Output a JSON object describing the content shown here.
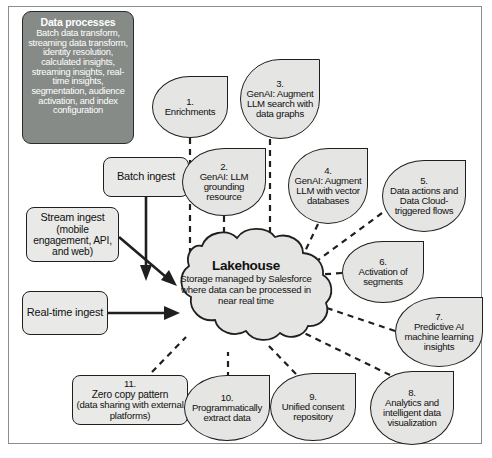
{
  "diagram": {
    "colors": {
      "panel_fill": "#878b87",
      "bubble_fill": "#e5e5e3",
      "box_fill": "#e9e9e7",
      "stroke": "#1f1f1f",
      "frame": "#8c8c8c",
      "background": "#ffffff",
      "panel_text": "#ffffff"
    }
  },
  "data_processes": {
    "title": "Data processes",
    "body": "Batch data transform, streaming data transform, identity resolution, calculated insights, streaming insights, real-time insights, segmentation, audience activation, and index configuration"
  },
  "ingest": {
    "batch": {
      "label": "Batch ingest"
    },
    "stream": {
      "label": "Stream ingest",
      "sub": "(mobile engagement, API, and web)"
    },
    "realtime": {
      "label": "Real-time ingest"
    }
  },
  "lakehouse": {
    "title": "Lakehouse",
    "body": "Storage managed by Salesforce where data can be processed in near real time"
  },
  "nodes": [
    {
      "num": "1.",
      "label": "Enrichments"
    },
    {
      "num": "2.",
      "label": "GenAI: LLM grounding resource"
    },
    {
      "num": "3.",
      "label": "GenAI: Augment LLM search with data graphs"
    },
    {
      "num": "4.",
      "label": "GenAI: Augment LLM with vector databases"
    },
    {
      "num": "5.",
      "label": "Data actions and Data Cloud-triggered flows"
    },
    {
      "num": "6.",
      "label": "Activation of segments"
    },
    {
      "num": "7.",
      "label": "Predictive AI machine learning insights"
    },
    {
      "num": "8.",
      "label": "Analytics and intelligent data visualization"
    },
    {
      "num": "9.",
      "label": "Unified consent repository"
    },
    {
      "num": "10.",
      "label": "Programmatically extract data"
    },
    {
      "num": "11.",
      "label": "Zero copy pattern",
      "sub": "(data sharing with external platforms)"
    }
  ]
}
